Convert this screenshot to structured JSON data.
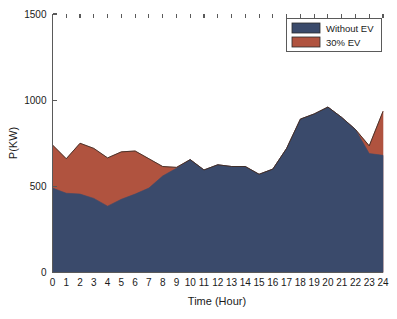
{
  "chart_data": {
    "type": "area",
    "title": "",
    "subtitle": "",
    "xlabel": "Time (Hour)",
    "ylabel": "P(KW)",
    "xlim": [
      0,
      24
    ],
    "ylim": [
      0,
      1500
    ],
    "xticks": [
      0,
      1,
      2,
      3,
      4,
      5,
      6,
      7,
      8,
      9,
      10,
      11,
      12,
      13,
      14,
      15,
      16,
      17,
      18,
      19,
      20,
      21,
      22,
      23,
      24
    ],
    "yticks": [
      0,
      500,
      1000,
      1500
    ],
    "grid": false,
    "stacked": false,
    "legend_position": "top-right",
    "x": [
      0,
      1,
      2,
      3,
      4,
      5,
      6,
      7,
      8,
      9,
      10,
      11,
      12,
      13,
      14,
      15,
      16,
      17,
      18,
      19,
      20,
      21,
      22,
      23,
      24
    ],
    "series": [
      {
        "name": "30% EV",
        "color": "#b0533f",
        "values": [
          740,
          660,
          750,
          720,
          665,
          700,
          705,
          660,
          615,
          610,
          655,
          595,
          625,
          615,
          615,
          570,
          600,
          720,
          890,
          920,
          960,
          900,
          830,
          735,
          935
        ]
      },
      {
        "name": "Without EV",
        "color": "#3a4a6b",
        "values": [
          490,
          460,
          455,
          430,
          385,
          425,
          455,
          490,
          560,
          605,
          655,
          595,
          625,
          615,
          615,
          570,
          600,
          720,
          890,
          920,
          960,
          900,
          830,
          690,
          680
        ]
      }
    ]
  },
  "legend": {
    "entries": [
      {
        "label": "Without EV",
        "color": "#3a4a6b"
      },
      {
        "label": "30% EV",
        "color": "#b0533f"
      }
    ]
  },
  "axes": {
    "y_label": "P(KW)",
    "x_label": "Time (Hour)",
    "y_tick_labels": [
      "0",
      "500",
      "1000",
      "1500"
    ],
    "x_tick_labels": [
      "0",
      "1",
      "2",
      "3",
      "4",
      "5",
      "6",
      "7",
      "8",
      "9",
      "10",
      "11",
      "12",
      "13",
      "14",
      "15",
      "16",
      "17",
      "18",
      "19",
      "20",
      "21",
      "22",
      "23",
      "24"
    ]
  },
  "colors": {
    "without_ev": "#3a4a6b",
    "ev_30": "#b0533f",
    "axis": "#5a5a5a",
    "text": "#1a1a1a",
    "background": "#ffffff"
  }
}
